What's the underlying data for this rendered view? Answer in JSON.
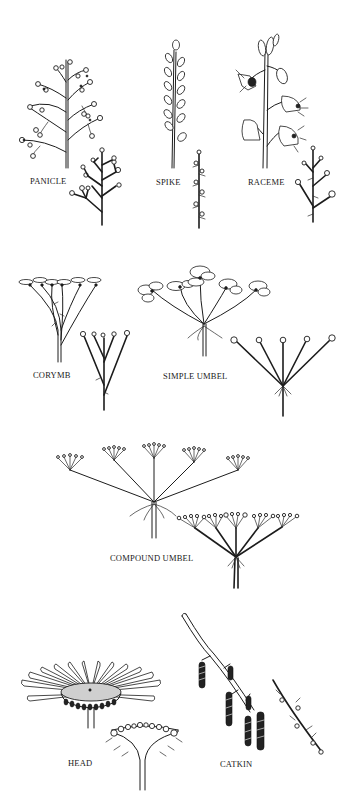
{
  "figure": {
    "panels": [
      {
        "id": "panicle",
        "label": "PANICLE"
      },
      {
        "id": "spike",
        "label": "SPIKE"
      },
      {
        "id": "raceme",
        "label": "RACEME"
      },
      {
        "id": "corymb",
        "label": "CORYMB"
      },
      {
        "id": "simple-umbel",
        "label": "SIMPLE UMBEL"
      },
      {
        "id": "compound-umbel",
        "label": "COMPOUND UMBEL"
      },
      {
        "id": "head",
        "label": "HEAD"
      },
      {
        "id": "catkin",
        "label": "CATKIN"
      }
    ]
  },
  "colors": {
    "background": "#ffffff",
    "ink": "#1c1c1c"
  }
}
